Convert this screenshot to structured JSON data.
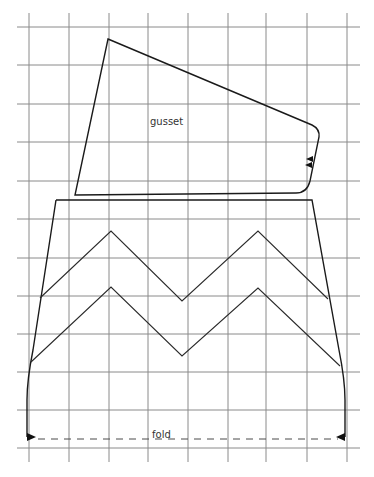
{
  "diagram": {
    "type": "sewing-pattern",
    "colors": {
      "background": "#ffffff",
      "grid": "#8a8a8a",
      "outline": "#1a1a1a",
      "fold": "#4a4a4a"
    },
    "grid": {
      "vertical_x": [
        29,
        69,
        109,
        148,
        188,
        228,
        266,
        307,
        347
      ],
      "vertical_y_range": [
        13,
        462
      ],
      "horizontal_y": [
        27,
        65,
        104,
        142,
        181,
        219,
        258,
        296,
        334,
        372,
        410,
        448
      ],
      "horizontal_x_range": [
        17,
        360
      ]
    },
    "pieces": {
      "gusset": {
        "label": "gusset",
        "label_position": [
          150,
          117
        ]
      },
      "main_piece": {
        "fold_label": "fold",
        "fold_label_position": [
          152,
          431
        ]
      }
    },
    "markers": [
      {
        "name": "notch-right-gusset-1",
        "type": "triangle-left"
      },
      {
        "name": "notch-right-gusset-2",
        "type": "triangle-left"
      },
      {
        "name": "fold-arrow-left",
        "type": "triangle-right"
      },
      {
        "name": "fold-arrow-right",
        "type": "triangle-left"
      }
    ]
  }
}
